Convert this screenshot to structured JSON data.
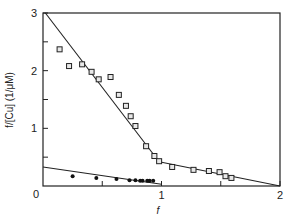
{
  "chart_data": {
    "type": "scatter",
    "title": "",
    "xlabel": "f",
    "ylabel": "f/[Cu] (1/μM)",
    "xlim": [
      0,
      2
    ],
    "ylim": [
      0,
      3
    ],
    "grid": false,
    "legend": null,
    "x_ticks": [
      0.5,
      1,
      1.5,
      2
    ],
    "x_tick_labels": [
      {
        "value": 1,
        "label": "1"
      },
      {
        "value": 2,
        "label": "2"
      }
    ],
    "y_ticks": [
      0.5,
      1,
      1.5,
      2,
      2.5,
      3
    ],
    "y_tick_labels": [
      {
        "value": 1,
        "label": "1"
      },
      {
        "value": 2,
        "label": "2"
      },
      {
        "value": 3,
        "label": "3"
      }
    ],
    "origin_label": "0",
    "series": [
      {
        "name": "open squares",
        "marker": "square",
        "points": [
          [
            0.14,
            2.37
          ],
          [
            0.22,
            2.08
          ],
          [
            0.33,
            2.11
          ],
          [
            0.41,
            1.98
          ],
          [
            0.47,
            1.85
          ],
          [
            0.57,
            1.89
          ],
          [
            0.64,
            1.58
          ],
          [
            0.7,
            1.39
          ],
          [
            0.74,
            1.21
          ],
          [
            0.78,
            1.04
          ],
          [
            0.87,
            0.69
          ],
          [
            0.94,
            0.52
          ],
          [
            0.98,
            0.43
          ],
          [
            1.09,
            0.33
          ],
          [
            1.27,
            0.28
          ],
          [
            1.4,
            0.26
          ],
          [
            1.49,
            0.24
          ],
          [
            1.54,
            0.17
          ],
          [
            1.59,
            0.14
          ]
        ]
      },
      {
        "name": "filled circles",
        "marker": "dot",
        "points": [
          [
            0.25,
            0.17
          ],
          [
            0.45,
            0.14
          ],
          [
            0.62,
            0.12
          ],
          [
            0.73,
            0.1
          ],
          [
            0.78,
            0.1
          ],
          [
            0.82,
            0.09
          ],
          [
            0.84,
            0.09
          ],
          [
            0.88,
            0.09
          ],
          [
            0.9,
            0.09
          ],
          [
            0.93,
            0.09
          ]
        ]
      }
    ],
    "fit_lines": [
      {
        "name": "steep segment",
        "from": [
          0.02,
          3.0
        ],
        "to": [
          0.98,
          0.42
        ]
      },
      {
        "name": "shallow segment",
        "from": [
          0.98,
          0.42
        ],
        "to": [
          2.0,
          0.0
        ]
      },
      {
        "name": "lower line",
        "from": [
          0.0,
          0.33
        ],
        "to": [
          1.0,
          0.03
        ]
      }
    ]
  },
  "layout": {
    "plot_left": 43,
    "plot_right": 280,
    "plot_top": 13,
    "plot_bottom": 186
  }
}
